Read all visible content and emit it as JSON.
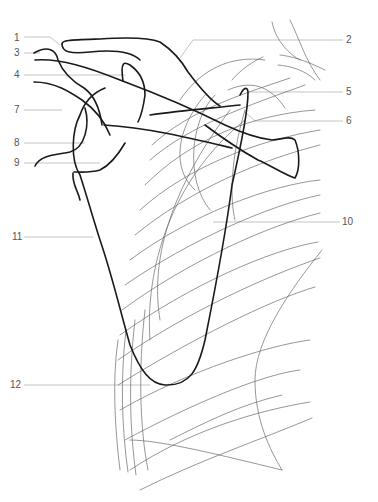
{
  "figure": {
    "type": "anatomical line drawing",
    "labels": [
      {
        "id": "1",
        "text": "1",
        "x": 14,
        "y": 33,
        "side": "left"
      },
      {
        "id": "2",
        "text": "2",
        "x": 346,
        "y": 35,
        "side": "right"
      },
      {
        "id": "3",
        "text": "3",
        "x": 14,
        "y": 48,
        "side": "left"
      },
      {
        "id": "4",
        "text": "4",
        "x": 14,
        "y": 70,
        "side": "left"
      },
      {
        "id": "5",
        "text": "5",
        "x": 346,
        "y": 87,
        "side": "right"
      },
      {
        "id": "6",
        "text": "6",
        "x": 346,
        "y": 117,
        "side": "right"
      },
      {
        "id": "7",
        "text": "7",
        "x": 14,
        "y": 105,
        "side": "left"
      },
      {
        "id": "8",
        "text": "8",
        "x": 14,
        "y": 138,
        "side": "left"
      },
      {
        "id": "9",
        "text": "9",
        "x": 14,
        "y": 158,
        "side": "left"
      },
      {
        "id": "10",
        "text": "10",
        "x": 342,
        "y": 217,
        "side": "right"
      },
      {
        "id": "11",
        "text": "11",
        "x": 12,
        "y": 232,
        "side": "left"
      },
      {
        "id": "12",
        "text": "12",
        "x": 10,
        "y": 380,
        "side": "left"
      }
    ]
  }
}
